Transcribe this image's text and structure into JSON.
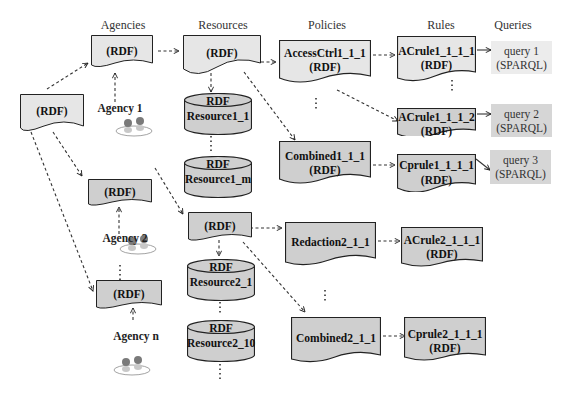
{
  "headers": {
    "agencies": "Agencies",
    "resources": "Resources",
    "policies": "Policies",
    "rules": "Rules",
    "queries": "Queries"
  },
  "root": {
    "label": "(RDF)"
  },
  "agencies": [
    {
      "doc_label": "(RDF)",
      "agent_label": "Agency 1"
    },
    {
      "doc_label": "(RDF)",
      "agent_label": "Agency 2"
    },
    {
      "doc_label": "(RDF)",
      "agent_label": "Agency n"
    }
  ],
  "resources": [
    {
      "doc_label": "(RDF)",
      "stores": [
        {
          "top": "RDF",
          "name": "Resource1_1"
        },
        {
          "top": "RDF",
          "name": "Resource1_m"
        }
      ]
    },
    {
      "doc_label": "(RDF)",
      "stores": [
        {
          "top": "RDF",
          "name": "Resource2_1"
        },
        {
          "top": "RDF",
          "name": "Resource2_10"
        }
      ]
    }
  ],
  "policies": [
    {
      "name": "AccessCtrl1_1_1",
      "sub": "(RDF)"
    },
    {
      "name": "Combined1_1_1",
      "sub": "(RDF)"
    },
    {
      "name": "Redaction2_1_1",
      "sub": ""
    },
    {
      "name": "Combined2_1_1",
      "sub": ""
    }
  ],
  "rules": [
    {
      "name": "ACrule1_1_1_1",
      "sub": "(RDF)"
    },
    {
      "name": "ACrule1_1_1_2",
      "sub": "(RDF)"
    },
    {
      "name": "Cprule1_1_1_1",
      "sub": "(RDF)"
    },
    {
      "name": "ACrule2_1_1_1",
      "sub": "(RDF)"
    },
    {
      "name": "Cprule2_1_1_1",
      "sub": "(RDF)"
    }
  ],
  "queries": [
    {
      "name": "query 1",
      "sub": "(SPARQL)"
    },
    {
      "name": "query 2",
      "sub": "(SPARQL)"
    },
    {
      "name": "query 3",
      "sub": "(SPARQL)"
    }
  ],
  "colors": {
    "light_fill": "#e6e6e6",
    "dark_fill": "#cfcfcf",
    "query1_fill": "#ececec",
    "query_fill": "#d6d6d6",
    "stroke": "#222222"
  }
}
